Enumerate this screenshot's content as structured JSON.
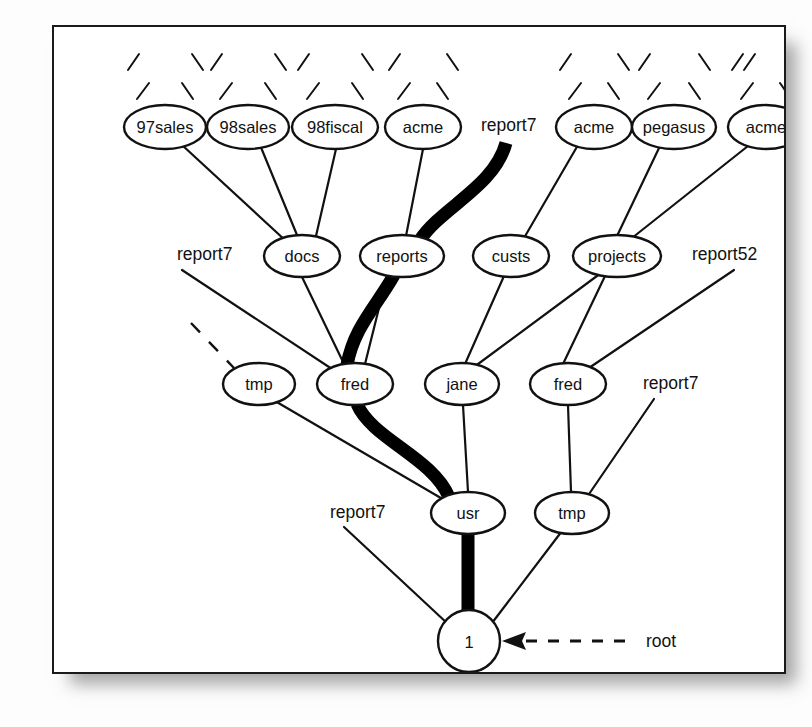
{
  "figure": {
    "background_color": "#ffffff",
    "border_color": "#1a1a1a",
    "edge_color": "#111111",
    "highlight_path_color": "#000000"
  },
  "nodes": {
    "level1": [
      {
        "id": "n97sales",
        "label": "97sales",
        "cx": 111,
        "cy": 100,
        "rx": 41,
        "ry": 22
      },
      {
        "id": "n98sales",
        "label": "98sales",
        "cx": 194,
        "cy": 100,
        "rx": 41,
        "ry": 22
      },
      {
        "id": "n98fiscal",
        "label": "98fiscal",
        "cx": 281,
        "cy": 100,
        "rx": 43,
        "ry": 22
      },
      {
        "id": "nacme1",
        "label": "acme",
        "cx": 369,
        "cy": 100,
        "rx": 38,
        "ry": 22
      },
      {
        "id": "nacme2",
        "label": "acme",
        "cx": 540,
        "cy": 100,
        "rx": 38,
        "ry": 22
      },
      {
        "id": "npegasus",
        "label": "pegasus",
        "cx": 620,
        "cy": 100,
        "rx": 42,
        "ry": 22
      },
      {
        "id": "nacme3",
        "label": "acme",
        "cx": 712,
        "cy": 100,
        "rx": 38,
        "ry": 22
      }
    ],
    "level2": [
      {
        "id": "ndocs",
        "label": "docs",
        "cx": 248,
        "cy": 229,
        "rx": 38,
        "ry": 21
      },
      {
        "id": "nreports",
        "label": "reports",
        "cx": 348,
        "cy": 229,
        "rx": 42,
        "ry": 21
      },
      {
        "id": "ncusts",
        "label": "custs",
        "cx": 457,
        "cy": 229,
        "rx": 38,
        "ry": 21
      },
      {
        "id": "nprojects",
        "label": "projects",
        "cx": 563,
        "cy": 229,
        "rx": 44,
        "ry": 21
      }
    ],
    "level3": [
      {
        "id": "ntmpL",
        "label": "tmp",
        "cx": 205,
        "cy": 357,
        "rx": 36,
        "ry": 21
      },
      {
        "id": "nfredL",
        "label": "fred",
        "cx": 301,
        "cy": 357,
        "rx": 38,
        "ry": 21
      },
      {
        "id": "njane",
        "label": "jane",
        "cx": 408,
        "cy": 357,
        "rx": 37,
        "ry": 21
      },
      {
        "id": "nfredR",
        "label": "fred",
        "cx": 514,
        "cy": 357,
        "rx": 38,
        "ry": 21
      }
    ],
    "level4": [
      {
        "id": "nusr",
        "label": "usr",
        "cx": 414,
        "cy": 486,
        "rx": 37,
        "ry": 21
      },
      {
        "id": "ntmpR",
        "label": "tmp",
        "cx": 518,
        "cy": 486,
        "rx": 37,
        "ry": 21
      }
    ],
    "root": {
      "id": "nroot",
      "label": "1",
      "cx": 415,
      "cy": 614,
      "r": 31
    }
  },
  "floating_labels": [
    {
      "id": "lbl-report7-top",
      "text": "report7",
      "x": 427,
      "y": 104
    },
    {
      "id": "lbl-report7-left",
      "text": "report7",
      "x": 123,
      "y": 233
    },
    {
      "id": "lbl-report52",
      "text": "report52",
      "x": 638,
      "y": 233
    },
    {
      "id": "lbl-report7-right",
      "text": "report7",
      "x": 589,
      "y": 362
    },
    {
      "id": "lbl-report7-bot",
      "text": "report7",
      "x": 276,
      "y": 491
    },
    {
      "id": "lbl-root",
      "text": "root",
      "x": 592,
      "y": 620
    }
  ],
  "annotation": {
    "root_arrow_label": "root",
    "arrow_style": "dashed-left-arrow"
  },
  "edges": {
    "thin": [
      "97sales -> docs",
      "98sales -> docs",
      "98fiscal -> docs",
      "acme(1) -> reports",
      "acme(2) -> custs",
      "pegasus -> projects",
      "acme(3) -> projects",
      "docs -> fred(left)",
      "reports -> fred(left)",
      "custs -> jane",
      "projects -> jane",
      "projects -> fred(right)",
      "report7(left) -> fred(left)",
      "report52 -> fred(right)",
      "report7(right) -> tmp(right)",
      "report7(bottom) -> 1",
      "tmp(left) -> usr",
      "jane -> usr",
      "fred(right) -> tmp(right)",
      "tmp(right) -> 1"
    ],
    "dashed": [
      "dangling-stub -> tmp(left)"
    ],
    "highlighted_path": [
      "report7(top)",
      "reports",
      "fred(left)",
      "usr",
      "1"
    ],
    "top_stubs_count_per_node": 2
  }
}
